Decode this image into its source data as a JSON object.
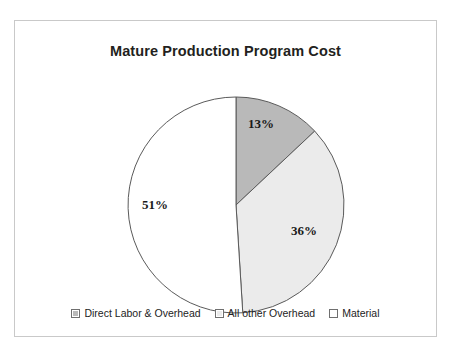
{
  "card": {
    "border_color": "#c9c9c9",
    "background": "#ffffff"
  },
  "chart_data": {
    "type": "pie",
    "title": "Mature Production Program Cost",
    "xlabel": "",
    "ylabel": "",
    "legend_position": "bottom",
    "grid": false,
    "start_angle_deg": 0,
    "direction": "clockwise",
    "categories": [
      "Direct Labor & Overhead",
      "All other Overhead",
      "Material"
    ],
    "values": [
      13,
      36,
      51
    ],
    "value_unit": "percent",
    "data_labels": [
      "13%",
      "36%",
      "51%"
    ],
    "colors": [
      "#b9b9b9",
      "#ebebeb",
      "#ffffff"
    ],
    "slice_border_color": "#5a5a5a",
    "slices": [
      {
        "label": "Direct Labor & Overhead",
        "value": 13,
        "data_label": "13%",
        "color": "#b9b9b9",
        "start_deg": 0,
        "end_deg": 46.8,
        "label_x": 246,
        "label_y": 107
      },
      {
        "label": "All other Overhead",
        "value": 36,
        "data_label": "36%",
        "color": "#ebebeb",
        "start_deg": 46.8,
        "end_deg": 176.4,
        "label_x": 289,
        "label_y": 214
      },
      {
        "label": "Material",
        "value": 51,
        "data_label": "51%",
        "color": "#ffffff",
        "start_deg": 176.4,
        "end_deg": 360,
        "label_x": 140,
        "label_y": 188
      }
    ],
    "geometry": {
      "center_x": 221,
      "center_y": 184,
      "radius": 108
    }
  },
  "legend": {
    "items": [
      {
        "label": "Direct Labor & Overhead",
        "color": "#b9b9b9",
        "swatch_name": "legend-swatch-direct-labor-overhead"
      },
      {
        "label": "All other Overhead",
        "color": "#ebebeb",
        "swatch_name": "legend-swatch-all-other-overhead"
      },
      {
        "label": "Material",
        "color": "#ffffff",
        "swatch_name": "legend-swatch-material"
      }
    ]
  }
}
